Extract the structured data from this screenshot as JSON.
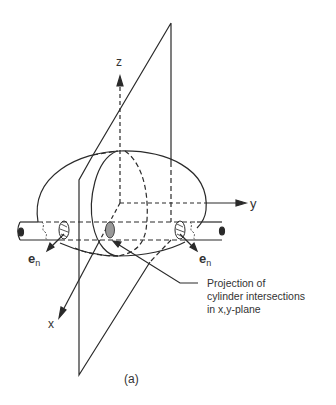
{
  "figure": {
    "caption": "(a)",
    "axes": {
      "z_label": "z",
      "y_label": "y",
      "x_label": "x"
    },
    "normal_labels": {
      "left": {
        "base": "e",
        "sub": "n"
      },
      "right": {
        "base": "e",
        "sub": "n"
      }
    },
    "annotation": {
      "line1": "Projection of",
      "line2": "cylinder intersections",
      "line3": "in x,y-plane"
    },
    "colors": {
      "stroke": "#2a2a2a",
      "text": "#333333",
      "background": "#ffffff"
    }
  }
}
